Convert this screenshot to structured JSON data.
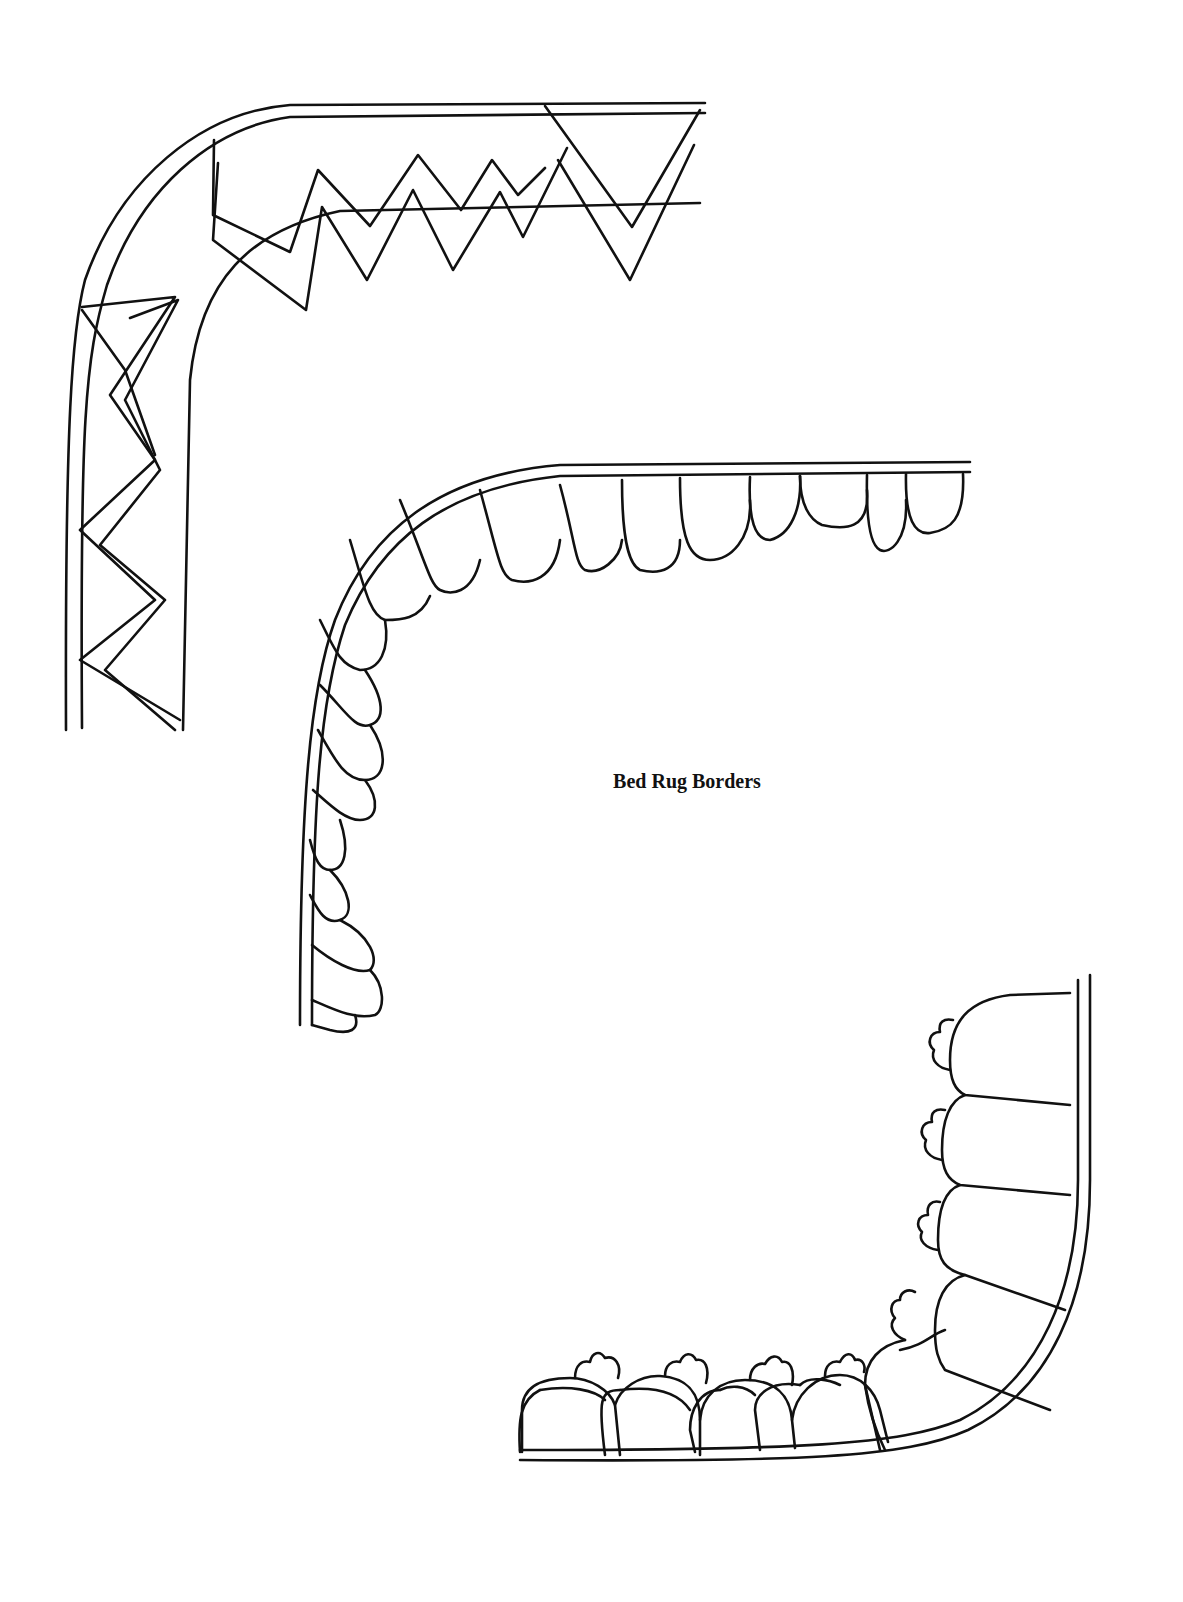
{
  "page": {
    "title": "Bed Rug Borders"
  },
  "figures": [
    {
      "id": "zigzag-border",
      "description": "Corner border with a double-line zigzag (chevron) band"
    },
    {
      "id": "scallop-border",
      "description": "Corner border with a row of elongated scallops/petals hanging from a double line"
    },
    {
      "id": "lobed-border",
      "description": "Corner border with rounded arch lobes and small trefoil buds, bottom-right corner"
    }
  ],
  "colors": {
    "ink": "#111111",
    "paper": "#ffffff"
  }
}
